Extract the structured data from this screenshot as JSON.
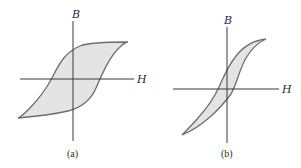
{
  "figure": {
    "panels": [
      {
        "id": "a",
        "caption": "(a)",
        "y_axis_label": "B",
        "x_axis_label": "H",
        "description": "Wide hysteresis loop (hard magnetic material)"
      },
      {
        "id": "b",
        "caption": "(b)",
        "y_axis_label": "B",
        "x_axis_label": "H",
        "description": "Narrow hysteresis loop (soft magnetic material)"
      }
    ],
    "colors": {
      "axis": "#3a3a3a",
      "loop_stroke": "#6e6e6e",
      "loop_fill": "#e4e4e4"
    }
  }
}
